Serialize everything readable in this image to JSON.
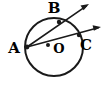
{
  "figure": {
    "type": "geometry-diagram",
    "background_color": "#ffffff",
    "stroke_color": "#1a1a1a",
    "canvas": {
      "width": 105,
      "height": 90
    }
  },
  "circle": {
    "name": "circle-O",
    "center_x": 54,
    "center_y": 47,
    "radius": 29,
    "stroke_width": 2.0,
    "fill": "none"
  },
  "center_point": {
    "label": "O",
    "dot_x": 48,
    "dot_y": 45,
    "dot_radius": 2.0,
    "label_x": 59,
    "label_y": 49
  },
  "points": [
    {
      "id": "A",
      "label": "A",
      "x": 27,
      "y": 47,
      "dot_radius": 2.4,
      "label_x": 14,
      "label_y": 49,
      "on_circle": true
    },
    {
      "id": "B",
      "label": "B",
      "x": 59,
      "y": 22,
      "dot_radius": 2.2,
      "label_x": 54,
      "label_y": 9,
      "on_circle": true
    },
    {
      "id": "C",
      "label": "C",
      "x": 79,
      "y": 35,
      "dot_radius": 2.2,
      "label_x": 86,
      "label_y": 46,
      "on_circle": true
    }
  ],
  "rays": [
    {
      "id": "ray-AB",
      "from": "A",
      "through": "B",
      "start_x": 27,
      "start_y": 47,
      "end_x": 89,
      "end_y": 4,
      "stroke_width": 1.6,
      "arrowhead": true
    },
    {
      "id": "ray-AC",
      "from": "A",
      "through": "C",
      "start_x": 27,
      "start_y": 47,
      "end_x": 101,
      "end_y": 27,
      "stroke_width": 1.6,
      "arrowhead": true
    }
  ],
  "arrowheads": [
    {
      "id": "arrowhead-AB",
      "tip_x": 89,
      "tip_y": 4
    },
    {
      "id": "arrowhead-AC",
      "tip_x": 101,
      "tip_y": 27
    }
  ]
}
